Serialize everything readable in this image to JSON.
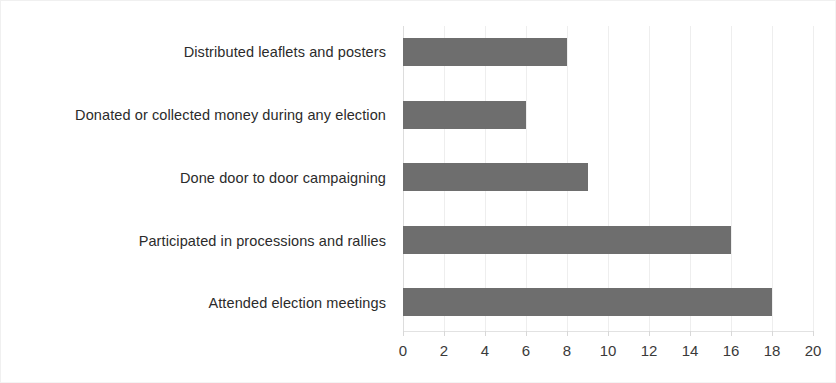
{
  "chart_data": {
    "type": "bar",
    "orientation": "horizontal",
    "title": "",
    "subtitle": "",
    "xlabel": "",
    "ylabel": "",
    "categories": [
      "Attended election meetings",
      "Participated in processions and rallies",
      "Done door to door campaigning",
      "Donated or collected money during any election",
      "Distributed leaflets and posters"
    ],
    "values": [
      18,
      16,
      9,
      6,
      8
    ],
    "series": [
      {
        "name": "",
        "values": [
          18,
          16,
          9,
          6,
          8
        ]
      }
    ],
    "bars": [
      {
        "label": "Distributed leaflets and posters",
        "value": 8
      },
      {
        "label": "Donated or collected money during any election",
        "value": 6
      },
      {
        "label": "Done door to door campaigning",
        "value": 9
      },
      {
        "label": "Participated in processions and rallies",
        "value": 16
      },
      {
        "label": "Attended election meetings",
        "value": 18
      }
    ],
    "xlim": [
      0,
      20
    ],
    "xticks": [
      0,
      2,
      4,
      6,
      8,
      10,
      12,
      14,
      16,
      18,
      20
    ],
    "xtick_labels": [
      "0",
      "2",
      "4",
      "6",
      "8",
      "10",
      "12",
      "14",
      "16",
      "18",
      "20"
    ],
    "grid": "vertical",
    "legend": "none",
    "colors": {
      "bar": "#6e6e6e",
      "background": "#ffffff",
      "gridline": "#eeeeee",
      "axis": "#e2e2e2",
      "text": "#2b2b2b"
    }
  }
}
